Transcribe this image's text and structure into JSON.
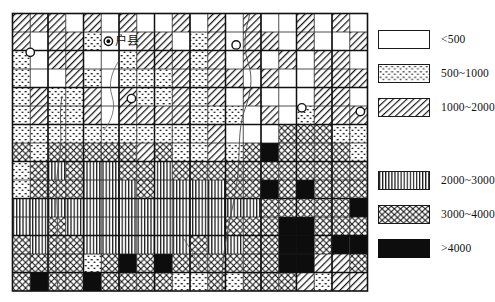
{
  "figure": {
    "type": "choropleth-grid-map",
    "map_label": "户县",
    "map_label_marker": "filled-circle-marker"
  },
  "legend": {
    "title": "",
    "items": [
      {
        "key": "lt500",
        "label": "<500",
        "pattern": "blank",
        "fill": "#ffffff"
      },
      {
        "key": "500_1000",
        "label": "500~1000",
        "pattern": "dots",
        "fill": "#ffffff"
      },
      {
        "key": "1000_2000",
        "label": "1000~2000",
        "pattern": "diagonal-hatch",
        "fill": "#ffffff"
      },
      {
        "key": "2000_3000",
        "label": "2000~3000",
        "pattern": "vertical-lines",
        "fill": "#ffffff"
      },
      {
        "key": "3000_4000",
        "label": "3000~4000",
        "pattern": "cross-hatch",
        "fill": "#ffffff"
      },
      {
        "key": "gt4000",
        "label": ">4000",
        "pattern": "solid-black",
        "fill": "#0d0d0d"
      }
    ]
  },
  "chart_data": {
    "type": "heatmap",
    "title": "",
    "xlabel": "",
    "ylabel": "",
    "grid": true,
    "legend_position": "right",
    "classes": [
      "lt500",
      "500_1000",
      "1000_2000",
      "2000_3000",
      "3000_4000",
      "gt4000"
    ],
    "class_labels": [
      "<500",
      "500~1000",
      "1000~2000",
      "2000~3000",
      "3000~4000",
      ">4000"
    ],
    "ncols": 20,
    "nrows": 15,
    "cells": [
      [
        "1000_2000",
        "1000_2000",
        "1000_2000",
        "lt500",
        "1000_2000",
        "lt500",
        "1000_2000",
        "lt500",
        "lt500",
        "1000_2000",
        "lt500",
        "1000_2000",
        "lt500",
        "1000_2000",
        "lt500",
        "lt500",
        "1000_2000",
        "lt500",
        "1000_2000",
        "lt500"
      ],
      [
        "1000_2000",
        "lt500",
        "1000_2000",
        "1000_2000",
        "500_1000",
        "lt500",
        "lt500",
        "1000_2000",
        "1000_2000",
        "lt500",
        "500_1000",
        "1000_2000",
        "lt500",
        "1000_2000",
        "1000_2000",
        "lt500",
        "1000_2000",
        "lt500",
        "lt500",
        "1000_2000"
      ],
      [
        "500_1000",
        "lt500",
        "1000_2000",
        "1000_2000",
        "lt500",
        "lt500",
        "500_1000",
        "1000_2000",
        "1000_2000",
        "1000_2000",
        "500_1000",
        "1000_2000",
        "lt500",
        "1000_2000",
        "lt500",
        "1000_2000",
        "lt500",
        "1000_2000",
        "1000_2000",
        "lt500"
      ],
      [
        "500_1000",
        "lt500",
        "lt500",
        "1000_2000",
        "500_1000",
        "lt500",
        "500_1000",
        "500_1000",
        "500_1000",
        "1000_2000",
        "500_1000",
        "1000_2000",
        "1000_2000",
        "lt500",
        "1000_2000",
        "lt500",
        "lt500",
        "1000_2000",
        "1000_2000",
        "1000_2000"
      ],
      [
        "500_1000",
        "1000_2000",
        "500_1000",
        "500_1000",
        "1000_2000",
        "lt500",
        "1000_2000",
        "500_1000",
        "500_1000",
        "1000_2000",
        "500_1000",
        "1000_2000",
        "lt500",
        "1000_2000",
        "lt500",
        "lt500",
        "lt500",
        "1000_2000",
        "1000_2000",
        "lt500"
      ],
      [
        "500_1000",
        "1000_2000",
        "500_1000",
        "500_1000",
        "1000_2000",
        "lt500",
        "1000_2000",
        "1000_2000",
        "1000_2000",
        "1000_2000",
        "500_1000",
        "500_1000",
        "500_1000",
        "lt500",
        "1000_2000",
        "lt500",
        "500_1000",
        "1000_2000",
        "1000_2000",
        "1000_2000"
      ],
      [
        "500_1000",
        "500_1000",
        "500_1000",
        "500_1000",
        "500_1000",
        "500_1000",
        "500_1000",
        "500_1000",
        "500_1000",
        "500_1000",
        "500_1000",
        "1000_2000",
        "lt500",
        "lt500",
        "lt500",
        "3000_4000",
        "3000_4000",
        "3000_4000",
        "500_1000",
        "500_1000"
      ],
      [
        "3000_4000",
        "500_1000",
        "3000_4000",
        "3000_4000",
        "3000_4000",
        "3000_4000",
        "3000_4000",
        "1000_2000",
        "3000_4000",
        "500_1000",
        "500_1000",
        "1000_2000",
        "500_1000",
        "3000_4000",
        "gt4000",
        "3000_4000",
        "3000_4000",
        "3000_4000",
        "3000_4000",
        "500_1000"
      ],
      [
        "500_1000",
        "3000_4000",
        "2000_3000",
        "3000_4000",
        "2000_3000",
        "2000_3000",
        "3000_4000",
        "3000_4000",
        "2000_3000",
        "3000_4000",
        "3000_4000",
        "3000_4000",
        "3000_4000",
        "3000_4000",
        "3000_4000",
        "3000_4000",
        "3000_4000",
        "3000_4000",
        "3000_4000",
        "3000_4000"
      ],
      [
        "500_1000",
        "3000_4000",
        "3000_4000",
        "3000_4000",
        "2000_3000",
        "2000_3000",
        "2000_3000",
        "3000_4000",
        "2000_3000",
        "2000_3000",
        "2000_3000",
        "2000_3000",
        "3000_4000",
        "3000_4000",
        "gt4000",
        "3000_4000",
        "gt4000",
        "3000_4000",
        "3000_4000",
        "3000_4000"
      ],
      [
        "2000_3000",
        "2000_3000",
        "2000_3000",
        "2000_3000",
        "2000_3000",
        "2000_3000",
        "2000_3000",
        "2000_3000",
        "2000_3000",
        "2000_3000",
        "2000_3000",
        "2000_3000",
        "2000_3000",
        "2000_3000",
        "3000_4000",
        "3000_4000",
        "3000_4000",
        "3000_4000",
        "3000_4000",
        "gt4000"
      ],
      [
        "2000_3000",
        "2000_3000",
        "3000_4000",
        "2000_3000",
        "2000_3000",
        "2000_3000",
        "2000_3000",
        "2000_3000",
        "2000_3000",
        "2000_3000",
        "2000_3000",
        "2000_3000",
        "3000_4000",
        "3000_4000",
        "3000_4000",
        "gt4000",
        "gt4000",
        "3000_4000",
        "3000_4000",
        "3000_4000"
      ],
      [
        "3000_4000",
        "2000_3000",
        "3000_4000",
        "3000_4000",
        "2000_3000",
        "2000_3000",
        "2000_3000",
        "2000_3000",
        "2000_3000",
        "2000_3000",
        "3000_4000",
        "2000_3000",
        "2000_3000",
        "3000_4000",
        "3000_4000",
        "gt4000",
        "gt4000",
        "3000_4000",
        "gt4000",
        "gt4000"
      ],
      [
        "3000_4000",
        "3000_4000",
        "3000_4000",
        "3000_4000",
        "500_1000",
        "3000_4000",
        "gt4000",
        "3000_4000",
        "gt4000",
        "3000_4000",
        "3000_4000",
        "3000_4000",
        "3000_4000",
        "3000_4000",
        "3000_4000",
        "gt4000",
        "gt4000",
        "1000_2000",
        "1000_2000",
        "3000_4000"
      ],
      [
        "3000_4000",
        "gt4000",
        "3000_4000",
        "3000_4000",
        "gt4000",
        "3000_4000",
        "3000_4000",
        "3000_4000",
        "3000_4000",
        "500_1000",
        "500_1000",
        "3000_4000",
        "500_1000",
        "3000_4000",
        "3000_4000",
        "3000_4000",
        "1000_2000",
        "500_1000",
        "1000_2000",
        "1000_2000"
      ]
    ],
    "point_markers": [
      {
        "name": "filled-circle-marker",
        "col": 5.4,
        "row": 1.5,
        "style": "filled"
      },
      {
        "name": "open-circle-marker",
        "col": 1.0,
        "row": 2.1,
        "style": "open"
      },
      {
        "name": "open-circle-marker",
        "col": 12.6,
        "row": 1.7,
        "style": "open"
      },
      {
        "name": "open-circle-marker",
        "col": 6.7,
        "row": 4.6,
        "style": "open"
      },
      {
        "name": "open-circle-marker",
        "col": 16.3,
        "row": 5.1,
        "style": "open"
      },
      {
        "name": "open-circle-marker",
        "col": 19.6,
        "row": 5.3,
        "style": "open"
      }
    ]
  }
}
